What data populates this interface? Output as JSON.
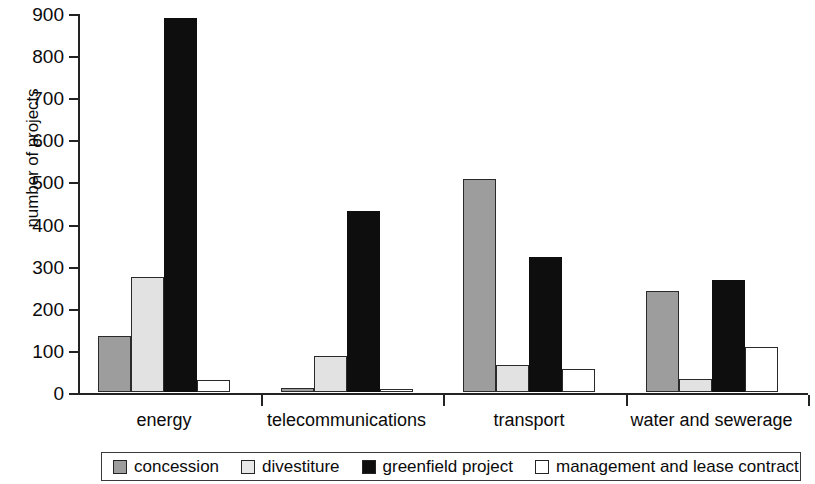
{
  "chart_data": {
    "type": "bar",
    "title": "",
    "subtitle": "",
    "xlabel": "",
    "ylabel": "number of projects",
    "ylim": [
      0,
      900
    ],
    "yticks": [
      0,
      100,
      200,
      300,
      400,
      500,
      600,
      700,
      800,
      900
    ],
    "grid": false,
    "legend_position": "bottom",
    "categories": [
      "energy",
      "telecommunications",
      "transport",
      "water and sewerage"
    ],
    "series": [
      {
        "name": "concession",
        "color": "#9d9d9d",
        "values": [
          133,
          10,
          505,
          240
        ]
      },
      {
        "name": "divestiture",
        "color": "#e2e2e2",
        "values": [
          272,
          85,
          65,
          32
        ]
      },
      {
        "name": "greenfield project",
        "color": "#0e0e0e",
        "values": [
          888,
          431,
          320,
          265
        ]
      },
      {
        "name": "management and lease contract",
        "color": "#ffffff",
        "values": [
          28,
          4,
          55,
          108
        ]
      }
    ]
  },
  "axis": {
    "y_title": "number of projects",
    "tick_labels": [
      "900",
      "800",
      "700",
      "600",
      "500",
      "400",
      "300",
      "200",
      "100",
      "0"
    ]
  },
  "legend": {
    "items": [
      {
        "label": "concession",
        "swatch": "concession"
      },
      {
        "label": "divestiture",
        "swatch": "divestiture"
      },
      {
        "label": "greenfield project",
        "swatch": "greenfield"
      },
      {
        "label": "management and lease contract",
        "swatch": "management"
      }
    ]
  },
  "colors": {
    "concession": "#9d9d9d",
    "divestiture": "#e2e2e2",
    "greenfield": "#0e0e0e",
    "management": "#ffffff",
    "axis": "#232323",
    "text": "#0b0b0b"
  }
}
